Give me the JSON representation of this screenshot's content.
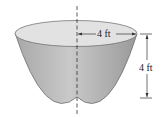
{
  "diagram": {
    "shape": "paraboloid tank",
    "radius_label": "4 ft",
    "height_label": "4 ft",
    "colors": {
      "top_surface": "#e0e0e0",
      "body_light": "#cfcfcf",
      "body_dark": "#9c9c9c",
      "outline": "#555555",
      "lines": "#333333"
    }
  }
}
